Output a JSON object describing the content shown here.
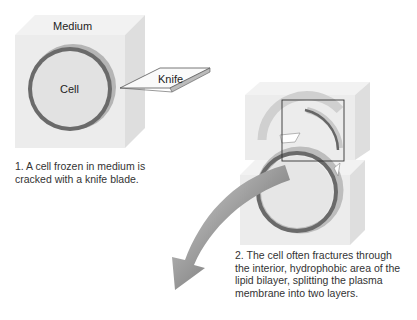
{
  "step1": {
    "medium_label": "Medium",
    "cell_label": "Cell",
    "knife_label": "Knife",
    "caption_lines": [
      "1. A cell frozen in medium is",
      "cracked with a knife blade."
    ]
  },
  "step2": {
    "caption_lines": [
      "2. The cell often fractures through",
      "the interior, hydrophobic area of the",
      "lipid bilayer, splitting the plasma",
      "membrane into two layers."
    ]
  },
  "colors": {
    "block_face": "#ececec",
    "block_side": "#dcdcdc",
    "block_top": "#f4f4f4",
    "membrane": "#6e6e6e",
    "membrane_shadow": "#bdbdbd",
    "arrow": "#7a7a7a"
  }
}
